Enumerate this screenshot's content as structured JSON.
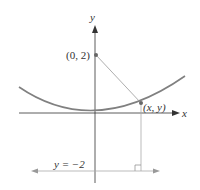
{
  "diagram": {
    "type": "parabola-focus-directrix",
    "axes": {
      "x_label": "x",
      "y_label": "y"
    },
    "points": [
      {
        "id": "focus",
        "label": "(0, 2)"
      },
      {
        "id": "curve-point",
        "label": "(x, y)"
      }
    ],
    "directrix": {
      "label": "y = −2"
    },
    "colors": {
      "curve": "#808080",
      "axis": "#333333",
      "guide_line": "#aaaaaa",
      "point": "#666666"
    }
  }
}
